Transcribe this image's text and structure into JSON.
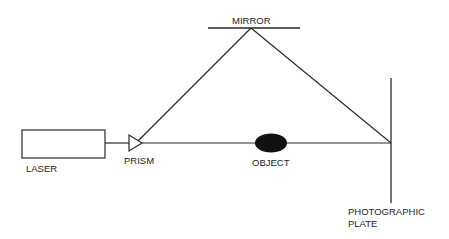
{
  "diagram": {
    "colors": {
      "line": "#2a2a2a",
      "object_fill": "#111111",
      "background": "#ffffff"
    },
    "components": {
      "laser": {
        "label": "LASER"
      },
      "prism": {
        "label": "PRISM"
      },
      "mirror": {
        "label": "MIRROR"
      },
      "object": {
        "label": "OBJECT"
      },
      "plate": {
        "label_line1": "PHOTOGRAPHIC",
        "label_line2": "PLATE"
      }
    },
    "beams": [
      {
        "name": "laser-to-prism"
      },
      {
        "name": "prism-to-object-to-plate"
      },
      {
        "name": "prism-to-mirror"
      },
      {
        "name": "mirror-to-plate"
      }
    ]
  }
}
